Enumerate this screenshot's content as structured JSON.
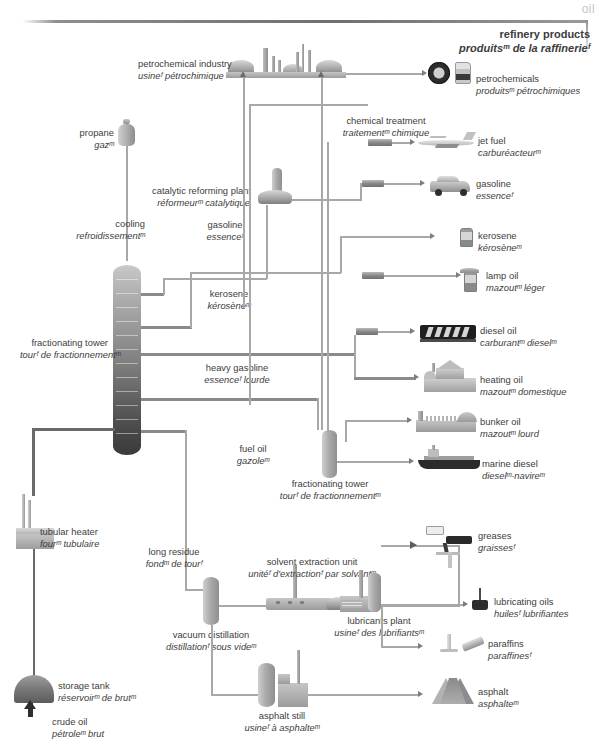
{
  "page": {
    "corner_tab": "oil",
    "title_en": "refinery products",
    "title_fr": "produitsᵐ de la raffinerieᶠ"
  },
  "diagram": {
    "type": "process-flow",
    "subject": "oil refinery products",
    "equipment": [
      {
        "id": "petrochemical-industry",
        "en": "petrochemical industry",
        "fr": "usineᶠ pétrochimique"
      },
      {
        "id": "chemical-treatment",
        "en": "chemical treatment",
        "fr": "traitementᵐ chimique"
      },
      {
        "id": "catalytic-reforming-plant",
        "en": "catalytic reforming plant",
        "fr": "réformeurᵐ catalytique"
      },
      {
        "id": "cooling",
        "en": "cooling",
        "fr": "refroidissementᵐ"
      },
      {
        "id": "fractionating-tower-main",
        "en": "fractionating tower",
        "fr": "tourᶠ de fractionnementᵐ"
      },
      {
        "id": "fractionating-tower-small",
        "en": "fractionating tower",
        "fr": "tourᶠ de fractionnementᵐ"
      },
      {
        "id": "tubular-heater",
        "en": "tubular heater",
        "fr": "fourᵐ tubulaire"
      },
      {
        "id": "storage-tank",
        "en": "storage tank",
        "fr": "réservoirᵐ de brutᵐ"
      },
      {
        "id": "solvent-extraction-unit",
        "en": "solvent extraction unit",
        "fr": "unitéᶠ d'extractionᶠ par solvantᵐ"
      },
      {
        "id": "vacuum-distillation",
        "en": "vacuum distillation",
        "fr": "distillationᶠ sous videᵐ"
      },
      {
        "id": "lubricants-plant",
        "en": "lubricants plant",
        "fr": "usineᶠ des lubrifiantsᵐ"
      },
      {
        "id": "asphalt-still",
        "en": "asphalt still",
        "fr": "usineᶠ à asphalteᵐ"
      }
    ],
    "streams": [
      {
        "id": "propane",
        "en": "propane",
        "fr": "gazᵐ"
      },
      {
        "id": "gasoline-stream",
        "en": "gasoline",
        "fr": "essenceᶠ"
      },
      {
        "id": "kerosene-stream",
        "en": "kerosene",
        "fr": "kérosèneᵐ"
      },
      {
        "id": "heavy-gasoline",
        "en": "heavy gasoline",
        "fr": "essenceᶠ lourde"
      },
      {
        "id": "fuel-oil",
        "en": "fuel oil",
        "fr": "gazoleᵐ"
      },
      {
        "id": "long-residue",
        "en": "long residue",
        "fr": "fondᵐ de tourᶠ"
      },
      {
        "id": "crude-oil",
        "en": "crude oil",
        "fr": "pétroleᵐ brut"
      }
    ],
    "products": [
      {
        "id": "petrochemicals",
        "en": "petrochemicals",
        "fr": "produitsᵐ pétrochimiques"
      },
      {
        "id": "jet-fuel",
        "en": "jet fuel",
        "fr": "carburéacteurᵐ"
      },
      {
        "id": "gasoline",
        "en": "gasoline",
        "fr": "essenceᶠ"
      },
      {
        "id": "kerosene",
        "en": "kerosene",
        "fr": "kérosèneᵐ"
      },
      {
        "id": "lamp-oil",
        "en": "lamp oil",
        "fr": "mazoutᵐ léger"
      },
      {
        "id": "diesel-oil",
        "en": "diesel oil",
        "fr": "carburantᵐ dieselᵐ"
      },
      {
        "id": "heating-oil",
        "en": "heating oil",
        "fr": "mazoutᵐ domestique"
      },
      {
        "id": "bunker-oil",
        "en": "bunker oil",
        "fr": "mazoutᵐ lourd"
      },
      {
        "id": "marine-diesel",
        "en": "marine diesel",
        "fr": "dieselᵐ-navireᵐ"
      },
      {
        "id": "greases",
        "en": "greases",
        "fr": "graissesᶠ"
      },
      {
        "id": "lubricating-oils",
        "en": "lubricating oils",
        "fr": "huilesᶠ lubrifiantes"
      },
      {
        "id": "paraffins",
        "en": "paraffins",
        "fr": "paraffinesᶠ"
      },
      {
        "id": "asphalt",
        "en": "asphalt",
        "fr": "asphalteᵐ"
      }
    ]
  },
  "colors": {
    "ink": "#3d3d3d",
    "pipe": "#9c9c9c",
    "pipe_dark": "#6a6a6a",
    "tab": "#c3c3c3",
    "metal_light": "#d2d2d2",
    "metal_dark": "#5c5c5c"
  }
}
